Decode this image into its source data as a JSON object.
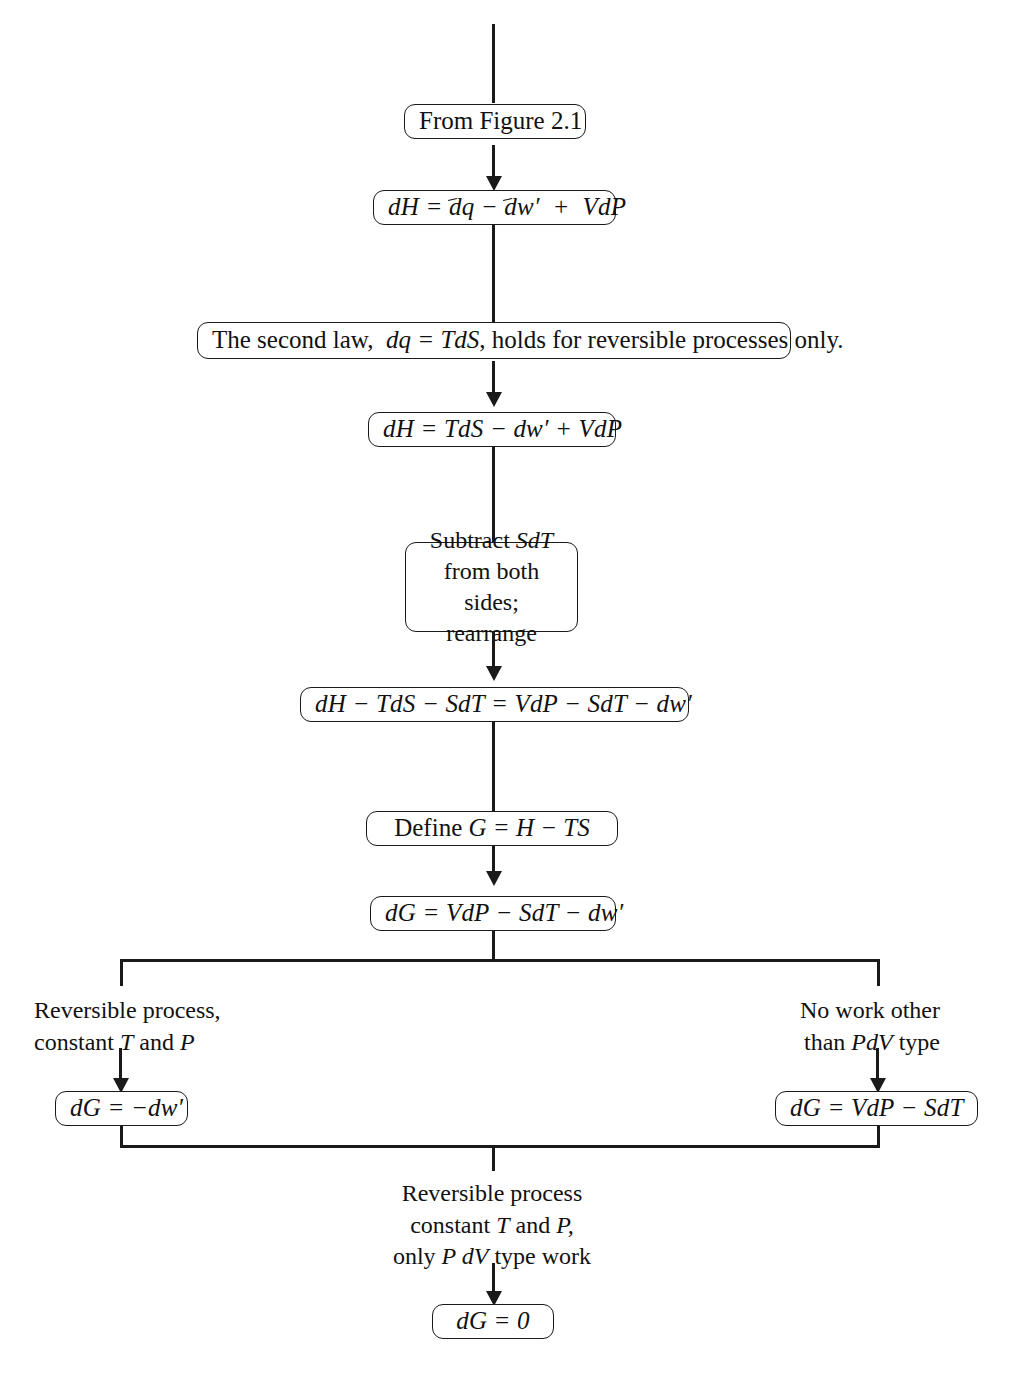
{
  "diagram": {
    "nodes": {
      "from_figure": "From Figure 2.1",
      "second_law": {
        "part1": "The second law,",
        "eq": "dq = TdS",
        "part2": ", holds for reversible processes only."
      },
      "subtract": {
        "line1_a": "Subtract",
        "line1_b": "SdT",
        "line2": "from both sides;",
        "line3": "rearrange"
      },
      "define_g": {
        "label": "Define",
        "eq": "G = H − TS"
      },
      "eq_dh_inexact": "dH = đq − đw′ + VdP",
      "eq_dh_tds": "dH = TdS − dw′ + VdP",
      "eq_rearranged": "dH − TdS − SdT = VdP − SdT − dw′",
      "eq_dg_full": "dG = VdP − SdT − dw′",
      "eq_dg_left": "dG = −dw′",
      "eq_dg_right": "dG = VdP − SdT",
      "eq_dg_zero": "dG = 0"
    },
    "captions": {
      "left_branch": {
        "line1": "Reversible process,",
        "line2_a": "constant",
        "line2_b": "T",
        "line2_c": "and",
        "line2_d": "P"
      },
      "right_branch": {
        "line1": "No work other",
        "line2_a": "than",
        "line2_b": "PdV",
        "line2_c": "type"
      },
      "merge": {
        "line1": "Reversible process",
        "line2_a": "constant",
        "line2_b": "T",
        "line2_c": "and",
        "line2_d": "P,",
        "line3_a": "only",
        "line3_b": "P dV",
        "line3_c": "type work"
      }
    },
    "colors": {
      "ink": "#1a1a1a",
      "background": "#ffffff"
    }
  }
}
